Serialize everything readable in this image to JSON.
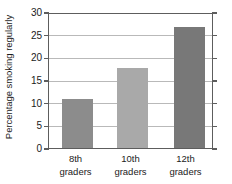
{
  "chart_data": {
    "type": "bar",
    "title": "",
    "subtitle": "",
    "xlabel": "",
    "ylabel": "Percentage smoking regularly",
    "categories": [
      "8th graders",
      "10th graders",
      "12th graders"
    ],
    "category_lines": [
      [
        "8th",
        "graders"
      ],
      [
        "10th",
        "graders"
      ],
      [
        "12th",
        "graders"
      ]
    ],
    "values": [
      10.8,
      17.7,
      26.7
    ],
    "ylim": [
      0,
      30
    ],
    "ytick_values": [
      0,
      5,
      10,
      15,
      20,
      25,
      30
    ],
    "ytick_labels": [
      "0",
      "5",
      "10",
      "15",
      "20",
      "25",
      "30"
    ],
    "grid": "horizontal",
    "legend": "none",
    "bar_colors": [
      "#8c8c8c",
      "#a9a9a9",
      "#787878"
    ],
    "axis_color": "#5d5d5d",
    "gridline_color": "#b9b9b9",
    "background_color": "#ffffff",
    "text_color": "#1b1b1b"
  }
}
